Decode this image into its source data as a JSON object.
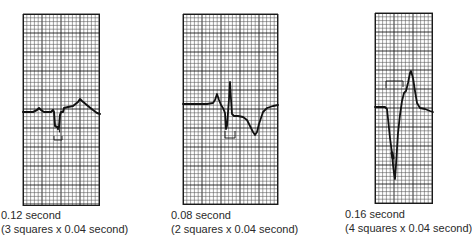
{
  "figure": {
    "grid": {
      "small_square_seconds": 0.04,
      "minor_line_color": "#555555",
      "major_line_color": "#1a1a1a",
      "trace_color": "#111111",
      "background": "#ffffff"
    },
    "panels": [
      {
        "id": "strip-1",
        "duration_label": "0.12 second",
        "calculation_label": "(3 squares x 0.04 second)",
        "squares": 3,
        "seconds_per_square": 0.04,
        "qrs_seconds": 0.12
      },
      {
        "id": "strip-2",
        "duration_label": "0.08 second",
        "calculation_label": "(2 squares x 0.04 second)",
        "squares": 2,
        "seconds_per_square": 0.04,
        "qrs_seconds": 0.08
      },
      {
        "id": "strip-3",
        "duration_label": "0.16 second",
        "calculation_label": "(4 squares x 0.04 second)",
        "squares": 4,
        "seconds_per_square": 0.04,
        "qrs_seconds": 0.16
      }
    ]
  }
}
